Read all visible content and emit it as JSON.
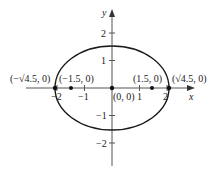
{
  "figure": {
    "type": "ellipse-plot",
    "equation_hint": "x^2/4.5 + y^2/2.25 = 1",
    "axes": {
      "x_label": "x",
      "y_label": "y",
      "x_ticks": [
        {
          "value": -2,
          "label": "−2"
        },
        {
          "value": -1,
          "label": "−1"
        },
        {
          "value": 1,
          "label": "1"
        },
        {
          "value": 2,
          "label": "2"
        }
      ],
      "y_ticks": [
        {
          "value": 2,
          "label": "2"
        },
        {
          "value": 1,
          "label": "1"
        },
        {
          "value": -1,
          "label": "−1"
        },
        {
          "value": -2,
          "label": "−2"
        }
      ]
    },
    "ellipse": {
      "center": [
        0,
        0
      ],
      "semi_major_x": 2.1213,
      "semi_minor_y": 1.5
    },
    "points": [
      {
        "x": -2.1213,
        "y": 0,
        "label": "(−√4.5, 0)"
      },
      {
        "x": -1.5,
        "y": 0,
        "label": "(−1.5, 0)"
      },
      {
        "x": 0,
        "y": 0,
        "label": "(0, 0)"
      },
      {
        "x": 1.5,
        "y": 0,
        "label": "(1.5, 0)"
      },
      {
        "x": 2.1213,
        "y": 0,
        "label": "(√4.5, 0)"
      }
    ],
    "colors": {
      "axis": "#555555",
      "curve": "#1a1a1a",
      "point": "#111111",
      "text": "#222222"
    }
  }
}
